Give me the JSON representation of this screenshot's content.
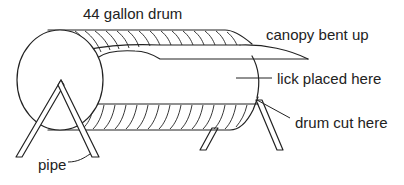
{
  "diagram": {
    "title": "",
    "labels": {
      "drum": "44 gallon drum",
      "canopy": "canopy bent up",
      "lick": "lick placed here",
      "cut": "drum cut here",
      "pipe": "pipe"
    },
    "parts": [
      {
        "id": "drum",
        "label": "44 gallon drum"
      },
      {
        "id": "canopy",
        "label": "canopy bent up"
      },
      {
        "id": "lick",
        "label": "lick placed here"
      },
      {
        "id": "cut",
        "label": "drum cut here"
      },
      {
        "id": "pipe",
        "label": "pipe"
      }
    ],
    "colors": {
      "line": "#222222",
      "background": "#ffffff"
    }
  }
}
